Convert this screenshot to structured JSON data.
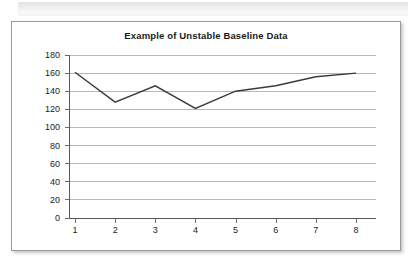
{
  "panel": {
    "border_color": "#9a9a9a",
    "background": "#ffffff"
  },
  "chart_data": {
    "type": "line",
    "title": "Example of Unstable Baseline Data",
    "xlabel": "",
    "ylabel": "",
    "categories": [
      "1",
      "2",
      "3",
      "4",
      "5",
      "6",
      "7",
      "8"
    ],
    "x": [
      1,
      2,
      3,
      4,
      5,
      6,
      7,
      8
    ],
    "values": [
      161,
      128,
      146,
      121,
      140,
      146,
      156,
      160
    ],
    "series": [
      {
        "name": "Baseline",
        "values": [
          161,
          128,
          146,
          121,
          140,
          146,
          156,
          160
        ],
        "color": "#3a3a3a"
      }
    ],
    "ylim": [
      0,
      180
    ],
    "y_ticks": [
      0,
      20,
      40,
      60,
      80,
      100,
      120,
      140,
      160,
      180
    ],
    "y_tick_labels": [
      "0",
      "20",
      "40",
      "60",
      "80",
      "100",
      "120",
      "140",
      "160",
      "180"
    ],
    "x_tick_labels": [
      "1",
      "2",
      "3",
      "4",
      "5",
      "6",
      "7",
      "8"
    ],
    "grid": true,
    "grid_color": "#b7b7b7",
    "axis_color": "#5a5a5a",
    "legend": null,
    "legend_position": "none",
    "markers": false,
    "annotations": []
  }
}
